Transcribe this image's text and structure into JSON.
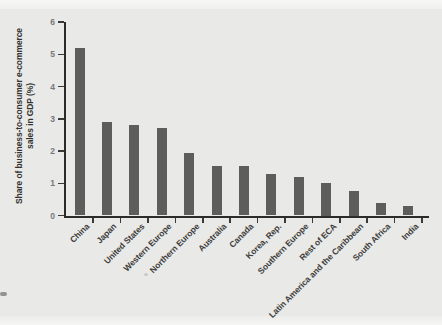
{
  "figure": {
    "background_color": "#e9e9e7",
    "y_axis_title_line1": "Share of business-to-consumer e-commerce",
    "y_axis_title_line2": "sales in GDP (%)"
  },
  "chart_data": {
    "type": "bar",
    "title": "",
    "xlabel": "",
    "ylabel": "Share of business-to-consumer e-commerce sales in GDP (%)",
    "categories": [
      "China",
      "Japan",
      "United States",
      "Western Europe",
      "Northern Europe",
      "Australia",
      "Canada",
      "Korea, Rep.",
      "Southern Europe",
      "Rest of ECA",
      "Latin America and the Caribbean",
      "South Africa",
      "India"
    ],
    "values": [
      5.2,
      2.9,
      2.8,
      2.7,
      1.95,
      1.55,
      1.55,
      1.3,
      1.2,
      1.0,
      0.75,
      0.4,
      0.3
    ],
    "ylim": [
      0,
      6
    ],
    "yticks": [
      0,
      1,
      2,
      3,
      4,
      5,
      6
    ],
    "grid": false,
    "legend": null,
    "bar_color": "#5d5d5b",
    "axis_color": "#2b2b29",
    "tick_label_color": "#787876",
    "category_label_color": "#3d3d3b"
  }
}
